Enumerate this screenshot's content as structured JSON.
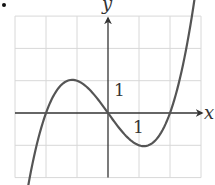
{
  "bullet": "•",
  "chart_data": {
    "type": "line",
    "title": "",
    "xlabel": "x",
    "ylabel": "y",
    "xlim": [
      -3,
      3
    ],
    "ylim": [
      -2,
      3
    ],
    "grid": true,
    "tick_labels": {
      "x": "1",
      "y": "1"
    },
    "function": "y = (x^3 - 4x)/3",
    "key_points": [
      {
        "x": -2,
        "y": 0,
        "type": "x-intercept"
      },
      {
        "x": -1,
        "y": 1,
        "type": "local maximum"
      },
      {
        "x": 0,
        "y": 0,
        "type": "x-intercept"
      },
      {
        "x": 1,
        "y": -1,
        "type": "local minimum"
      },
      {
        "x": 2,
        "y": 0,
        "type": "x-intercept"
      }
    ],
    "x": [
      -2.7,
      -2.5,
      -2,
      -1.5,
      -1,
      -0.5,
      0,
      0.5,
      1,
      1.5,
      2,
      2.5,
      2.95
    ],
    "series": [
      {
        "name": "curve",
        "values": [
          -1.96,
          -1.88,
          0,
          0.88,
          1,
          0.63,
          0,
          -0.63,
          -1,
          -0.88,
          0,
          1.88,
          4.62
        ]
      }
    ],
    "arrows": [
      "both-ends"
    ]
  },
  "colors": {
    "curve": "#555555",
    "axes": "#333333",
    "grid": "#d8d8d8"
  }
}
